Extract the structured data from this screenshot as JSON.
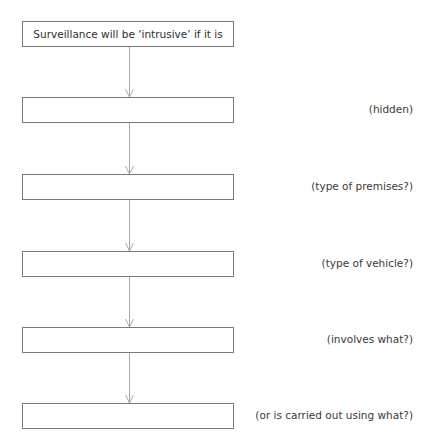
{
  "diagram": {
    "type": "flowchart",
    "colors": {
      "box_border": "#7a7a7a",
      "connector": "#a8a8a8",
      "text": "#333333"
    },
    "start_box": {
      "text": "Surveillance will be ‘intrusive’ if it is"
    },
    "steps": [
      {
        "box_text": "",
        "hint": "(hidden)"
      },
      {
        "box_text": "",
        "hint": "(type of premises?)"
      },
      {
        "box_text": "",
        "hint": "(type of vehicle?)"
      },
      {
        "box_text": "",
        "hint": "(involves what?)"
      },
      {
        "box_text": "",
        "hint": "(or is carried out using what?)"
      }
    ]
  }
}
